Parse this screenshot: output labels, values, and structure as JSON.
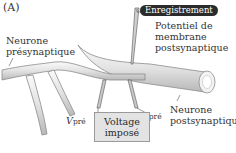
{
  "panel_label": "(A)",
  "labels": {
    "presynaptic_line1": "Neurone",
    "presynaptic_line2": "présynaptique",
    "recording_badge": "Enregistrement",
    "potential_line1": "Potentiel de",
    "potential_line2": "membrane",
    "potential_line3": "postsynaptique",
    "postsynaptic_line1": "Neurone",
    "postsynaptic_line2": "postsynaptique",
    "v_pre_main": "V",
    "v_pre_sub": "pré",
    "i_pre_main": "I",
    "i_pre_sub": "pré",
    "voltage_line1": "Voltage",
    "voltage_line2": "imposé"
  },
  "colors": {
    "neuron_fill": "#e6e6e6",
    "neuron_stroke": "#8c8c8c",
    "badge_bg": "#2b2b2b",
    "box_bg": "#e3e3e3"
  }
}
